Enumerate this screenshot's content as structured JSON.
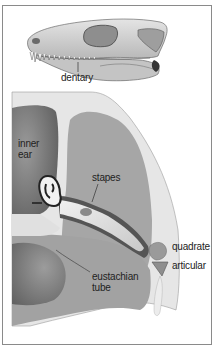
{
  "figure": {
    "type": "anatomical-diagram",
    "skull_panel": {
      "labels": [
        {
          "id": "dentary",
          "text": "dentary"
        }
      ]
    },
    "ear_panel": {
      "labels": [
        {
          "id": "inner_ear",
          "text": "inner ear",
          "lines": [
            "inner",
            "ear"
          ]
        },
        {
          "id": "stapes",
          "text": "stapes"
        },
        {
          "id": "quadrate",
          "text": "quadrate"
        },
        {
          "id": "articular",
          "text": "articular"
        },
        {
          "id": "eustachian_tube",
          "text": "eustachian tube",
          "lines": [
            "eustachian",
            "tube"
          ]
        }
      ]
    },
    "colors": {
      "border": "#8a8a8a",
      "bone_light": "#d6d6d6",
      "bone_mid": "#b4b4b4",
      "tissue": "#a8a8a8",
      "cavity_dark": "#7a7a7a",
      "outline": "#3a3a3a"
    }
  }
}
